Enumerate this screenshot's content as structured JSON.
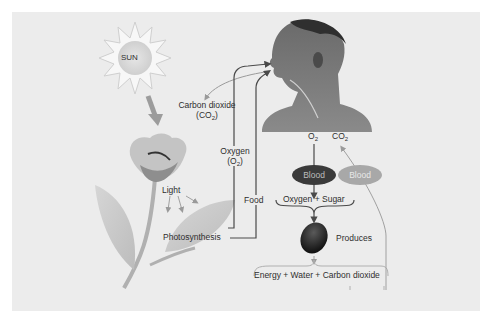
{
  "diagram": {
    "colors": {
      "background": "#ececec",
      "line": "#4a4a4a",
      "light_line": "#9a9a9a",
      "blood_dark": "#3a3a3a",
      "blood_light": "#a8a8a8",
      "sun": "#d9d9d9",
      "skin": "#5a5a5a"
    },
    "nodes": {
      "sun": {
        "label": "SUN"
      },
      "light": {
        "label": "Light"
      },
      "photosynthesis": {
        "label": "Photosynthesis"
      },
      "carbon_dioxide": {
        "label": "Carbon dioxide",
        "formula_prefix": "(CO",
        "formula_sub": "2",
        "formula_suffix": ")"
      },
      "oxygen": {
        "label": "Oxygen",
        "formula_prefix": "(O",
        "formula_sub": "2",
        "formula_suffix": ")"
      },
      "food": {
        "label": "Food"
      },
      "o2_label": {
        "prefix": "O",
        "sub": "2"
      },
      "co2_label": {
        "prefix": "CO",
        "sub": "2"
      },
      "blood_dark": {
        "label": "Blood"
      },
      "blood_light": {
        "label": "Blood"
      },
      "oxygen_sugar": {
        "label": "Oxygen + Sugar"
      },
      "produces": {
        "label": "Produces"
      },
      "outputs": {
        "label": "Energy + Water + Carbon dioxide"
      }
    },
    "edges": [
      {
        "from": "sun",
        "to": "flower",
        "label": ""
      },
      {
        "from": "boy",
        "to": "carbon_dioxide",
        "label": ""
      },
      {
        "from": "photosynthesis",
        "to": "boy",
        "label": "Oxygen (O2)"
      },
      {
        "from": "photosynthesis",
        "to": "boy",
        "label": "Food"
      },
      {
        "from": "boy",
        "to": "blood_dark",
        "label": "O2"
      },
      {
        "from": "blood_dark",
        "to": "oxygen_sugar",
        "label": ""
      },
      {
        "from": "oxygen_sugar",
        "to": "red_blood_cell",
        "label": ""
      },
      {
        "from": "red_blood_cell",
        "to": "outputs",
        "label": "Produces"
      },
      {
        "from": "outputs",
        "to": "boy",
        "label": "CO2"
      }
    ]
  }
}
